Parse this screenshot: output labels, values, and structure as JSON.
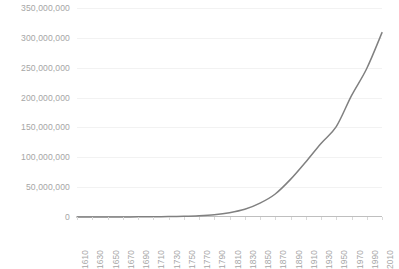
{
  "chart": {
    "title": "",
    "line_color": "#808080",
    "grid_color": "#f2f2f2",
    "axis_color": "#bfbfbf",
    "label_color": "#a6a6a6"
  },
  "chart_data": {
    "type": "line",
    "title": "",
    "xlabel": "",
    "ylabel": "",
    "xlim": [
      1610,
      2010
    ],
    "ylim": [
      0,
      350000000
    ],
    "grid": true,
    "legend": "none",
    "y_ticks": [
      0,
      50000000,
      100000000,
      150000000,
      200000000,
      250000000,
      300000000,
      350000000
    ],
    "y_tick_labels": [
      "0",
      "50,000,000",
      "100,000,000",
      "150,000,000",
      "200,000,000",
      "250,000,000",
      "300,000,000",
      "350,000,000"
    ],
    "x_ticks": [
      1610,
      1630,
      1650,
      1670,
      1690,
      1710,
      1730,
      1750,
      1770,
      1790,
      1810,
      1830,
      1850,
      1870,
      1890,
      1910,
      1930,
      1950,
      1970,
      1990,
      2010
    ],
    "x_tick_labels": [
      "1610",
      "1630",
      "1650",
      "1670",
      "1690",
      "1710",
      "1730",
      "1750",
      "1770",
      "1790",
      "1810",
      "1830",
      "1850",
      "1870",
      "1890",
      "1910",
      "1930",
      "1950",
      "1970",
      "1990",
      "2010"
    ],
    "x": [
      1610,
      1630,
      1650,
      1670,
      1690,
      1710,
      1730,
      1750,
      1770,
      1790,
      1810,
      1830,
      1850,
      1870,
      1890,
      1910,
      1930,
      1950,
      1970,
      1990,
      2010
    ],
    "values": [
      350,
      4646,
      50368,
      111935,
      210372,
      331711,
      629445,
      1170760,
      2148076,
      3929214,
      7239881,
      12866020,
      23191876,
      38558371,
      62979766,
      92228496,
      123202624,
      151325798,
      203211926,
      248709873,
      308745538
    ],
    "series": [
      {
        "name": "Population",
        "values": [
          350,
          4646,
          50368,
          111935,
          210372,
          331711,
          629445,
          1170760,
          2148076,
          3929214,
          7239881,
          12866020,
          23191876,
          38558371,
          62979766,
          92228496,
          123202624,
          151325798,
          203211926,
          248709873,
          308745538
        ]
      }
    ]
  }
}
